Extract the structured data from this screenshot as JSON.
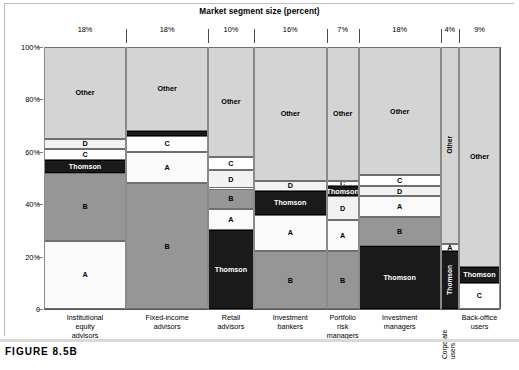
{
  "figure": {
    "caption": "FIGURE 8.5B",
    "title": "Market segment size (percent)"
  },
  "axis": {
    "y_ticks": [
      "100%",
      "80%",
      "60%",
      "40%",
      "20%",
      "0"
    ],
    "y_values": [
      100,
      80,
      60,
      40,
      20,
      0
    ]
  },
  "colors": {
    "other": "#d4d4d4",
    "thomson": "#1a1a1a",
    "thomson_text": "#ffffff",
    "a": "#fafafa",
    "b": "#969696",
    "c": "#ffffff",
    "d": "#f2f2f2",
    "gridline": "#8a8a8a",
    "background": "#ffffff"
  },
  "chart_data": {
    "type": "bar",
    "title": "Market segment size (percent)",
    "xlabel": "",
    "ylabel": "",
    "ylim": [
      0,
      100
    ],
    "grid": false,
    "legend": "inline-labels",
    "stacked": true,
    "categories": [
      "Institutional equity advisors",
      "Fixed-income advisors",
      "Retail advisors",
      "Investment bankers",
      "Portfolio risk managers",
      "Investment managers",
      "Corporate users",
      "Back-office users"
    ],
    "segment_widths_percent": [
      18,
      18,
      10,
      16,
      7,
      18,
      4,
      9
    ],
    "columns": [
      {
        "name": "Institutional equity advisors",
        "label_lines": [
          "Institutional",
          "equity",
          "advisors"
        ],
        "width_percent": 18,
        "segments": [
          {
            "label": "A",
            "value": 26,
            "fill": "a"
          },
          {
            "label": "B",
            "value": 26,
            "fill": "b"
          },
          {
            "label": "Thomson",
            "value": 5,
            "fill": "thomson"
          },
          {
            "label": "C",
            "value": 4,
            "fill": "c"
          },
          {
            "label": "D",
            "value": 4,
            "fill": "d"
          },
          {
            "label": "Other",
            "value": 35,
            "fill": "other"
          }
        ]
      },
      {
        "name": "Fixed-income advisors",
        "label_lines": [
          "Fixed-income",
          "advisors"
        ],
        "width_percent": 18,
        "segments": [
          {
            "label": "B",
            "value": 48,
            "fill": "b"
          },
          {
            "label": "A",
            "value": 12,
            "fill": "a"
          },
          {
            "label": "C",
            "value": 6,
            "fill": "c"
          },
          {
            "label": "Thomson",
            "value": 2,
            "fill": "thomson"
          },
          {
            "label": "Other",
            "value": 32,
            "fill": "other"
          }
        ]
      },
      {
        "name": "Retail advisors",
        "label_lines": [
          "Retail",
          "advisors"
        ],
        "width_percent": 10,
        "segments": [
          {
            "label": "Thomson",
            "value": 30,
            "fill": "thomson"
          },
          {
            "label": "A",
            "value": 8,
            "fill": "a"
          },
          {
            "label": "B",
            "value": 8,
            "fill": "b"
          },
          {
            "label": "D",
            "value": 7,
            "fill": "d"
          },
          {
            "label": "C",
            "value": 5,
            "fill": "c"
          },
          {
            "label": "Other",
            "value": 42,
            "fill": "other"
          }
        ]
      },
      {
        "name": "Investment bankers",
        "label_lines": [
          "Investment",
          "bankers"
        ],
        "width_percent": 16,
        "segments": [
          {
            "label": "B",
            "value": 22,
            "fill": "b"
          },
          {
            "label": "A",
            "value": 14,
            "fill": "a"
          },
          {
            "label": "Thomson",
            "value": 9,
            "fill": "thomson"
          },
          {
            "label": "D",
            "value": 4,
            "fill": "d"
          },
          {
            "label": "Other",
            "value": 51,
            "fill": "other"
          }
        ]
      },
      {
        "name": "Portfolio risk managers",
        "label_lines": [
          "Portfolio",
          "risk",
          "managers"
        ],
        "width_percent": 7,
        "segments": [
          {
            "label": "B",
            "value": 22,
            "fill": "b"
          },
          {
            "label": "A",
            "value": 12,
            "fill": "a"
          },
          {
            "label": "D",
            "value": 9,
            "fill": "d"
          },
          {
            "label": "Thomson",
            "value": 4,
            "fill": "thomson"
          },
          {
            "label": "C",
            "value": 2,
            "fill": "c"
          },
          {
            "label": "Other",
            "value": 51,
            "fill": "other"
          }
        ]
      },
      {
        "name": "Investment managers",
        "label_lines": [
          "Investment",
          "managers"
        ],
        "width_percent": 18,
        "segments": [
          {
            "label": "Thomson",
            "value": 24,
            "fill": "thomson"
          },
          {
            "label": "B",
            "value": 11,
            "fill": "b"
          },
          {
            "label": "A",
            "value": 8,
            "fill": "a"
          },
          {
            "label": "D",
            "value": 4,
            "fill": "d"
          },
          {
            "label": "C",
            "value": 4,
            "fill": "c"
          },
          {
            "label": "Other",
            "value": 49,
            "fill": "other"
          }
        ]
      },
      {
        "name": "Corporate users",
        "label_lines": [
          "Corporate",
          "users"
        ],
        "width_percent": 4,
        "vertical_label": true,
        "segments": [
          {
            "label": "Thomson",
            "value": 22,
            "fill": "thomson",
            "vertical": true
          },
          {
            "label": "A",
            "value": 3,
            "fill": "a"
          },
          {
            "label": "Other",
            "value": 75,
            "fill": "other",
            "vertical": true
          }
        ]
      },
      {
        "name": "Back-office users",
        "label_lines": [
          "Back-office",
          "users"
        ],
        "width_percent": 9,
        "segments": [
          {
            "label": "C",
            "value": 10,
            "fill": "c"
          },
          {
            "label": "Thomson",
            "value": 6,
            "fill": "thomson"
          },
          {
            "label": "Other",
            "value": 84,
            "fill": "other"
          }
        ]
      }
    ]
  }
}
